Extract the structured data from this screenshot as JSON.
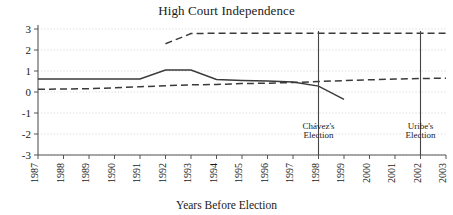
{
  "chart_data": {
    "type": "line",
    "title": "High Court Independence",
    "xlabel": "Years Before Election",
    "ylabel": "",
    "xlim": [
      1987,
      2003
    ],
    "ylim": [
      -3,
      3
    ],
    "grid": true,
    "legend_position": "none",
    "xticks": [
      "1987",
      "1988",
      "1989",
      "1990",
      "1991",
      "1992",
      "1993",
      "1994",
      "1995",
      "1996",
      "1997",
      "1998",
      "1999",
      "2000",
      "2001",
      "2002",
      "2003"
    ],
    "yticks": [
      "3",
      "2",
      "1",
      "0",
      "-1",
      "-2",
      "-3"
    ],
    "series": [
      {
        "name": "Venezuela (solid)",
        "style": "solid",
        "color": "#3a3a3a",
        "x": [
          1987,
          1988,
          1989,
          1990,
          1991,
          1992,
          1993,
          1994,
          1995,
          1996,
          1997,
          1998,
          1999
        ],
        "values": [
          0.62,
          0.62,
          0.62,
          0.62,
          0.62,
          1.05,
          1.05,
          0.6,
          0.55,
          0.52,
          0.48,
          0.28,
          -0.35
        ]
      },
      {
        "name": "Colombia lower (dashed)",
        "style": "dashed",
        "color": "#3a3a3a",
        "x": [
          1987,
          1988,
          1989,
          1990,
          1991,
          1992,
          1993,
          1994,
          1995,
          1996,
          1997,
          1998,
          1999,
          2000,
          2001,
          2002,
          2003
        ],
        "values": [
          0.13,
          0.14,
          0.16,
          0.2,
          0.25,
          0.3,
          0.34,
          0.36,
          0.4,
          0.42,
          0.45,
          0.5,
          0.54,
          0.58,
          0.62,
          0.64,
          0.66
        ]
      },
      {
        "name": "Upper dashed",
        "style": "dashed",
        "color": "#3a3a3a",
        "x": [
          1992,
          1993,
          1994,
          1995,
          1996,
          1997,
          1998,
          1999,
          2000,
          2001,
          2002,
          2003
        ],
        "values": [
          2.3,
          2.78,
          2.8,
          2.8,
          2.8,
          2.8,
          2.8,
          2.8,
          2.8,
          2.8,
          2.8,
          2.8
        ]
      }
    ],
    "annotations": [
      {
        "name": "chavez-election",
        "label_line1": "Chávez's",
        "label_line2": "Election",
        "x": 1998
      },
      {
        "name": "uribe-election",
        "label_line1": "Uribe's",
        "label_line2": "Election",
        "x": 2002
      }
    ]
  }
}
